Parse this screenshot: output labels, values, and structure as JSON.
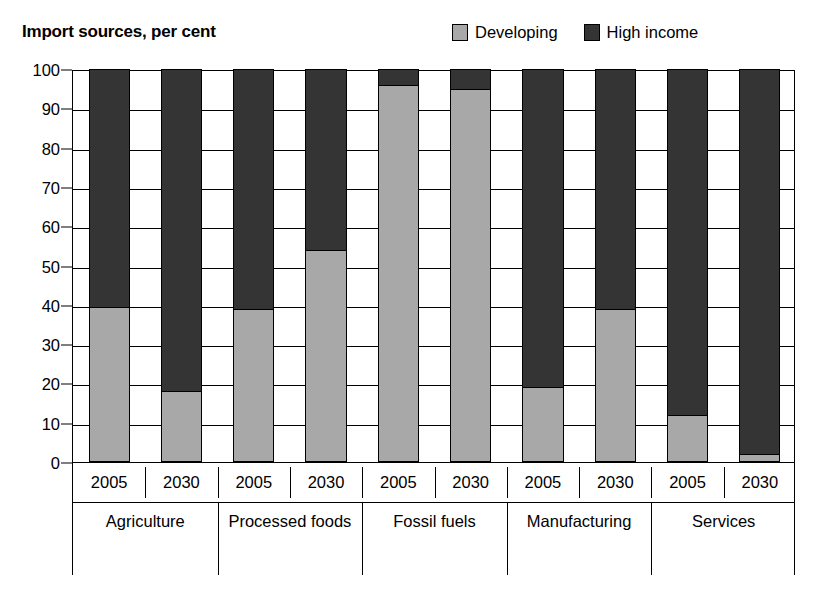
{
  "chart_data": {
    "type": "bar",
    "subtype": "stacked-column",
    "title": "Import sources, per cent",
    "xlabel": "",
    "ylabel": "",
    "ylim": [
      0,
      100
    ],
    "ytick_values": [
      0,
      10,
      20,
      30,
      40,
      50,
      60,
      70,
      80,
      90,
      100
    ],
    "ytick_labels": [
      "0",
      "10",
      "20",
      "30",
      "40",
      "50",
      "60",
      "70",
      "80",
      "90",
      "100"
    ],
    "grid": true,
    "legend_position": "top-right",
    "groups": [
      "Agriculture",
      "Processed foods",
      "Fossil fuels",
      "Manufacturing",
      "Services"
    ],
    "years": [
      "2005",
      "2030"
    ],
    "categories": [
      "Agriculture 2005",
      "Agriculture 2030",
      "Processed foods 2005",
      "Processed foods 2030",
      "Fossil fuels 2005",
      "Fossil fuels 2030",
      "Manufacturing 2005",
      "Manufacturing 2030",
      "Services 2005",
      "Services 2030"
    ],
    "series": [
      {
        "name": "Developing",
        "color": "#a8a8a8",
        "values": [
          39.5,
          18,
          39,
          54,
          96,
          95,
          19,
          39,
          12,
          2
        ]
      },
      {
        "name": "High income",
        "color": "#343434",
        "values": [
          60.5,
          82,
          61,
          46,
          4,
          5,
          81,
          61,
          88,
          98
        ]
      }
    ]
  },
  "legend": {
    "items": [
      {
        "label": "Developing",
        "color": "#a8a8a8",
        "swatch": "developing-swatch"
      },
      {
        "label": "High income",
        "color": "#343434",
        "swatch": "high-income-swatch"
      }
    ]
  },
  "axis": {
    "year_labels": [
      "2005",
      "2030",
      "2005",
      "2030",
      "2005",
      "2030",
      "2005",
      "2030",
      "2005",
      "2030"
    ],
    "group_labels": [
      "Agriculture",
      "Processed foods",
      "Fossil fuels",
      "Manufacturing",
      "Services"
    ]
  }
}
